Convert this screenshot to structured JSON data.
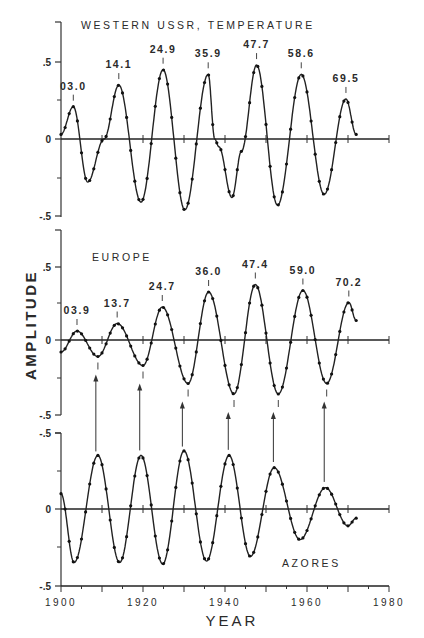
{
  "figure": {
    "xlabel": "YEAR",
    "ylabel": "AMPLITUDE",
    "x_ticks": [
      "1900",
      "1920",
      "1940",
      "1960",
      "1980"
    ]
  },
  "chart_data": [
    {
      "type": "line",
      "title": "WESTERN USSR, TEMPERATURE",
      "xlabel": "YEAR",
      "ylabel": "AMPLITUDE",
      "xlim": [
        1900,
        1980
      ],
      "ylim": [
        -0.5,
        0.75
      ],
      "y_ticks": [
        ".5",
        "0",
        "-.5"
      ],
      "grid": false,
      "peak_labels": [
        {
          "year": 1903.0,
          "text": "03.0"
        },
        {
          "year": 1914.1,
          "text": "14.1"
        },
        {
          "year": 1924.9,
          "text": "24.9"
        },
        {
          "year": 1935.9,
          "text": "35.9"
        },
        {
          "year": 1947.7,
          "text": "47.7"
        },
        {
          "year": 1958.6,
          "text": "58.6"
        },
        {
          "year": 1969.5,
          "text": "69.5"
        }
      ],
      "x": [
        1900,
        1903.0,
        1906.5,
        1910.5,
        1914.1,
        1919.5,
        1924.9,
        1930.2,
        1935.9,
        1937.5,
        1938.5,
        1941.7,
        1944.0,
        1947.7,
        1952.8,
        1958.6,
        1964.2,
        1969.5,
        1972
      ],
      "values": [
        0.03,
        0.21,
        -0.28,
        0.0,
        0.35,
        -0.41,
        0.45,
        -0.46,
        0.42,
        0.0,
        -0.05,
        -0.38,
        -0.08,
        0.48,
        -0.43,
        0.42,
        -0.36,
        0.26,
        0.03
      ]
    },
    {
      "type": "line",
      "title": "EUROPE",
      "xlabel": "YEAR",
      "ylabel": "AMPLITUDE",
      "xlim": [
        1900,
        1980
      ],
      "ylim": [
        -0.5,
        0.75
      ],
      "y_ticks": [
        ".5",
        "0",
        "-.5"
      ],
      "grid": false,
      "peak_labels": [
        {
          "year": 1903.9,
          "text": "03.9"
        },
        {
          "year": 1913.7,
          "text": "13.7"
        },
        {
          "year": 1924.7,
          "text": "24.7"
        },
        {
          "year": 1936.0,
          "text": "36.0"
        },
        {
          "year": 1947.4,
          "text": "47.4"
        },
        {
          "year": 1959.0,
          "text": "59.0"
        },
        {
          "year": 1970.2,
          "text": "70.2"
        }
      ],
      "trough_years": [
        1909.0,
        1920.0,
        1931.0,
        1942.2,
        1953.0,
        1964.8
      ],
      "x": [
        1900,
        1903.9,
        1909.0,
        1913.7,
        1920.0,
        1924.7,
        1931.0,
        1936.0,
        1942.2,
        1947.4,
        1953.0,
        1959.0,
        1964.8,
        1970.2,
        1972
      ],
      "values": [
        -0.08,
        0.06,
        -0.11,
        0.11,
        -0.17,
        0.22,
        -0.29,
        0.32,
        -0.36,
        0.37,
        -0.36,
        0.33,
        -0.29,
        0.25,
        0.13
      ]
    },
    {
      "type": "line",
      "title": "AZORES",
      "xlabel": "YEAR",
      "ylabel": "AMPLITUDE",
      "xlim": [
        1900,
        1980
      ],
      "ylim": [
        -0.5,
        0.5
      ],
      "y_ticks": [
        "-.5",
        "0",
        "-.5"
      ],
      "grid": false,
      "x": [
        1900,
        1903.2,
        1909.0,
        1914.3,
        1919.5,
        1924.8,
        1930.0,
        1935.5,
        1941.0,
        1946.2,
        1952.0,
        1958.3,
        1964.5,
        1970.0,
        1972
      ],
      "values": [
        0.1,
        -0.35,
        0.35,
        -0.35,
        0.35,
        -0.36,
        0.38,
        -0.34,
        0.35,
        -0.31,
        0.27,
        -0.2,
        0.14,
        -0.11,
        -0.06
      ]
    }
  ],
  "arrows": {
    "description": "Arrows link Azores peaks to Europe troughs",
    "years": [
      1908.5,
      1919.2,
      1929.6,
      1940.8,
      1951.8,
      1964.2
    ]
  }
}
